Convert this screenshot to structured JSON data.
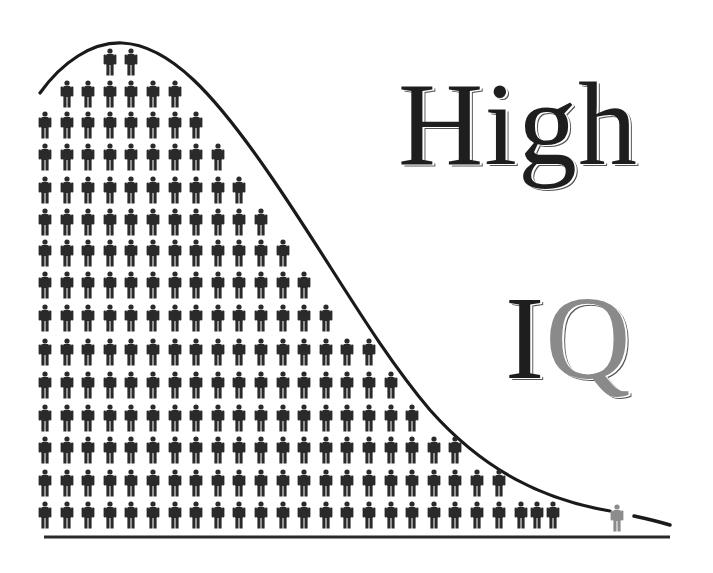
{
  "chart_data": {
    "type": "pictograph",
    "title": "High IQ",
    "title_words": [
      "High",
      "IQ"
    ],
    "xlabel": "",
    "ylabel": "",
    "grid": false,
    "legend": null,
    "rows_top_to_bottom": [
      {
        "y": 62,
        "start_col": 3,
        "count": 2
      },
      {
        "y": 94,
        "start_col": 1,
        "count": 6
      },
      {
        "y": 125,
        "start_col": 0,
        "count": 8
      },
      {
        "y": 157,
        "start_col": 0,
        "count": 9
      },
      {
        "y": 190,
        "start_col": 0,
        "count": 10
      },
      {
        "y": 222,
        "start_col": 0,
        "count": 11
      },
      {
        "y": 253,
        "start_col": 0,
        "count": 12
      },
      {
        "y": 285,
        "start_col": 0,
        "count": 13
      },
      {
        "y": 318,
        "start_col": 0,
        "count": 14
      },
      {
        "y": 352,
        "start_col": 0,
        "count": 16
      },
      {
        "y": 385,
        "start_col": 0,
        "count": 17
      },
      {
        "y": 418,
        "start_col": 0,
        "count": 18
      },
      {
        "y": 450,
        "start_col": 0,
        "count": 20
      },
      {
        "y": 483,
        "start_col": 0,
        "count": 22
      },
      {
        "y": 515,
        "start_col": 0,
        "count": 25
      }
    ],
    "column_x_start": 45,
    "column_spacing": 21.6,
    "outlier": {
      "x": 617,
      "y": 518,
      "count": 1,
      "color": "#8c8c8c"
    },
    "total_figures_in_curve": 207,
    "colors": {
      "figure": "#2a2a2a",
      "curve": "#1a1a1a",
      "baseline": "#2a2a2a",
      "outlier": "#8c8c8c",
      "background": "#ffffff"
    }
  },
  "title": {
    "high": "High",
    "iq_i": "I",
    "iq_q": "Q"
  }
}
